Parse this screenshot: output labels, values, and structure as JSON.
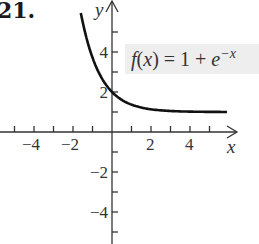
{
  "problem": {
    "number": "21."
  },
  "chart_data": {
    "type": "line",
    "title": "",
    "function_label": "f(x) = 1 + e^{-x}",
    "label_parts": {
      "f": "f",
      "lp": "(",
      "x": "x",
      "rp": ")",
      "eq": " = 1 + ",
      "e": "e",
      "exp": "−x"
    },
    "xlabel": "x",
    "ylabel": "y",
    "xlim": [
      -5.7,
      6.2
    ],
    "ylim": [
      -5.6,
      6.5
    ],
    "x_tick_labels": [
      "−4",
      "−2",
      "2",
      "4"
    ],
    "x_ticks": [
      -5,
      -4,
      -3,
      -2,
      -1,
      1,
      2,
      3,
      4,
      5
    ],
    "y_tick_labels": [
      "4",
      "2",
      "−2",
      "−4"
    ],
    "y_ticks": [
      5,
      4,
      3,
      2,
      1,
      -1,
      -2,
      -3,
      -4,
      -5
    ],
    "series": [
      {
        "name": "f(x) = 1 + e^(-x)",
        "x": [
          -1.6,
          -1.2,
          -0.8,
          -0.4,
          0,
          0.5,
          1,
          1.5,
          2,
          3,
          4,
          5.9
        ],
        "y": [
          5.95,
          4.32,
          3.23,
          2.49,
          2.0,
          1.61,
          1.37,
          1.22,
          1.14,
          1.05,
          1.02,
          1.0
        ]
      }
    ],
    "grid": false,
    "legend": "none",
    "colors": {
      "curve": "#111111",
      "axis": "#333333",
      "label_bg": "#eeeeee"
    }
  }
}
